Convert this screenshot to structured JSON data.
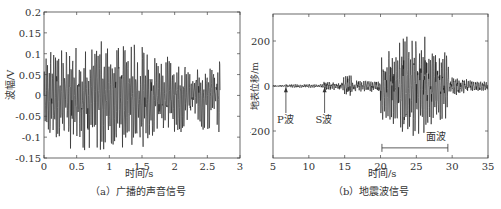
{
  "chart_data": [
    {
      "type": "line",
      "title": "",
      "caption": "（a）广播的声音信号",
      "xlabel": "时间/s",
      "ylabel": "波幅/V",
      "xlim": [
        0,
        3
      ],
      "ylim": [
        -0.15,
        0.2
      ],
      "xticks": [
        "0",
        "0.5",
        "1",
        "1.5",
        "2",
        "2.5",
        "3"
      ],
      "yticks": [
        "0.2",
        "0.15",
        "0.1",
        "0.05",
        "0",
        "-0.05",
        "-0.1",
        "-0.15"
      ],
      "grid": false,
      "series": [
        {
          "name": "声音信号",
          "description": "dense oscillating waveform from 0 to ~2.7 s, amplitude roughly ±0.1 V, peaks up to ~0.15 V and down to ~-0.14 V"
        }
      ]
    },
    {
      "type": "line",
      "title": "",
      "caption": "（b）地震波信号",
      "xlabel": "时间/s",
      "ylabel": "地表位移/m",
      "xlim": [
        5,
        35
      ],
      "ylim": [
        -320,
        320
      ],
      "xticks": [
        "5",
        "10",
        "15",
        "20",
        "25",
        "30",
        "35"
      ],
      "yticks": [
        "200",
        "0",
        "-200"
      ],
      "grid": false,
      "annotations": [
        {
          "text": "P波",
          "x": 6.8
        },
        {
          "text": "S波",
          "x": 12.2
        },
        {
          "text": "面波",
          "x_range": [
            20.2,
            29.4
          ]
        }
      ],
      "series": [
        {
          "name": "地震波",
          "description": "near-zero until ~6.8 s (P wave), small oscillations after ~12 s (S wave), burst at ~15 s, large surface waves 20–30 s with peaks near ±300 at ~24 s and ~26 s, decaying to 35 s"
        }
      ]
    }
  ]
}
